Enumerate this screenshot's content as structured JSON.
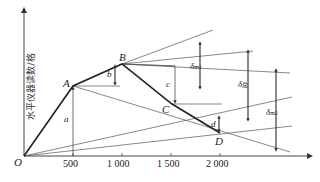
{
  "diagram": {
    "y_axis_label": "水平仪器读数/格",
    "origin_label": "O",
    "x_ticks": [
      "500",
      "1 000",
      "1 500",
      "2 000"
    ],
    "points": {
      "A": "A",
      "B": "B",
      "C": "C",
      "D": "D"
    },
    "dimension_labels": {
      "a": "a",
      "b": "b",
      "c": "c",
      "d": "d",
      "delta_m1": "δ",
      "delta_m1_sub": "m1",
      "delta_total": "δ",
      "delta_total_sub": "总",
      "delta_m2": "δ",
      "delta_m2_sub": "m2"
    }
  }
}
